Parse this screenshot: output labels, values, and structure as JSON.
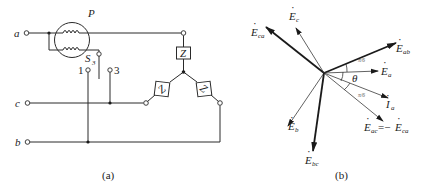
{
  "figure_a": {
    "caption": "(a)",
    "terminals": {
      "a": "a",
      "b": "b",
      "c": "c"
    },
    "meter_label": "P",
    "switch_label": "S",
    "switch_sub": "3",
    "switch_pos_1": "1",
    "switch_pos_3": "3",
    "impedance_label": "Z"
  },
  "figure_b": {
    "caption": "(b)",
    "angle_label": "θ",
    "angle_fraction": "π/6",
    "phasors": {
      "E_ca": {
        "main": "E",
        "sub": "ca"
      },
      "E_c": {
        "main": "E",
        "sub": "c"
      },
      "E_ab": {
        "main": "E",
        "sub": "ab"
      },
      "E_a": {
        "main": "E",
        "sub": "a"
      },
      "I_a": {
        "main": "I",
        "sub": "a"
      },
      "E_ac": {
        "main": "E",
        "sub": "ac",
        "eq": "=−",
        "rhs_main": "E",
        "rhs_sub": "ca"
      },
      "E_b": {
        "main": "E",
        "sub": "b"
      },
      "E_bc": {
        "main": "E",
        "sub": "bc"
      }
    }
  }
}
